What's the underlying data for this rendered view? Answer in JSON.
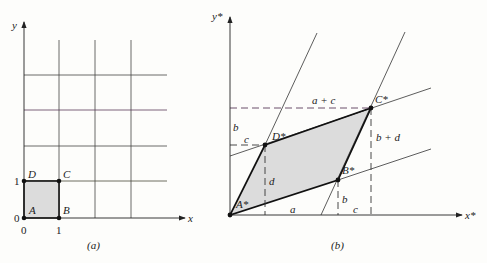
{
  "panel_a": {
    "caption": "(a)",
    "x_axis_label": "x",
    "y_axis_label": "y",
    "tick_x": [
      "0",
      "1"
    ],
    "tick_y": [
      "0",
      "1"
    ],
    "vertices": {
      "A": "A",
      "B": "B",
      "C": "C",
      "D": "D"
    }
  },
  "panel_b": {
    "caption": "(b)",
    "x_axis_label": "x*",
    "y_axis_label": "y*",
    "vertices": {
      "A": "A*",
      "B": "B*",
      "C": "C*",
      "D": "D*"
    },
    "dimension_labels": {
      "top": "a + c",
      "left_b": "b",
      "left_c": "c",
      "right_bd": "b + d",
      "d": "d",
      "b_small": "b",
      "bottom_a": "a",
      "bottom_c": "c"
    }
  },
  "colors": {
    "line": "#222222",
    "fill": "#dcdcdc",
    "grid_tint": "#6a4a6a"
  }
}
